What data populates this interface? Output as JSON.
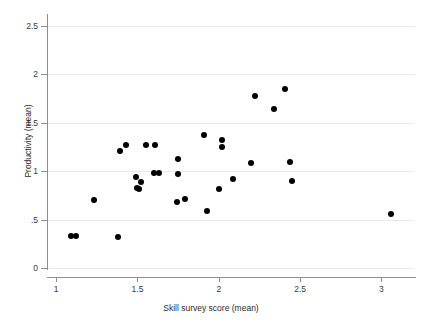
{
  "chart_data": {
    "type": "scatter",
    "title": "",
    "xlabel": "Skill survey score (mean)",
    "ylabel": "Productivity (mean)",
    "xlim": [
      0.95,
      3.2
    ],
    "ylim": [
      0,
      2.6
    ],
    "grid": true,
    "legend": "none",
    "marker": {
      "shape": "circle",
      "color": "#000000",
      "size_px": 6
    },
    "xticks": [
      1,
      1.5,
      2,
      2.5,
      3
    ],
    "xticklabels": [
      "1",
      "1.5",
      "2",
      "2.5",
      "3"
    ],
    "yticks": [
      0,
      0.5,
      1,
      1.5,
      2,
      2.5
    ],
    "yticklabels": [
      "0",
      ".5",
      "1",
      "1.5",
      "2",
      "2.5"
    ],
    "x": [
      1.09,
      1.12,
      1.23,
      1.38,
      1.39,
      1.43,
      1.49,
      1.5,
      1.51,
      1.52,
      1.55,
      1.6,
      1.61,
      1.63,
      1.74,
      1.75,
      1.75,
      1.79,
      1.91,
      1.93,
      2.0,
      2.02,
      2.02,
      2.09,
      2.2,
      2.22,
      2.34,
      2.41,
      2.44,
      2.45,
      3.06
    ],
    "y": [
      0.335,
      0.33,
      0.705,
      0.315,
      1.21,
      1.27,
      0.94,
      0.83,
      0.82,
      0.89,
      1.27,
      0.98,
      1.27,
      0.98,
      0.685,
      1.12,
      0.965,
      0.715,
      1.375,
      0.585,
      0.81,
      1.32,
      1.245,
      0.915,
      1.08,
      1.77,
      1.64,
      1.85,
      1.09,
      0.895,
      0.555
    ],
    "points": [
      {
        "x": 1.09,
        "y": 0.335
      },
      {
        "x": 1.12,
        "y": 0.33
      },
      {
        "x": 1.23,
        "y": 0.705
      },
      {
        "x": 1.38,
        "y": 0.315
      },
      {
        "x": 1.39,
        "y": 1.21
      },
      {
        "x": 1.43,
        "y": 1.27
      },
      {
        "x": 1.49,
        "y": 0.94
      },
      {
        "x": 1.5,
        "y": 0.83
      },
      {
        "x": 1.51,
        "y": 0.82
      },
      {
        "x": 1.52,
        "y": 0.89
      },
      {
        "x": 1.55,
        "y": 1.27
      },
      {
        "x": 1.6,
        "y": 0.98
      },
      {
        "x": 1.61,
        "y": 1.27
      },
      {
        "x": 1.63,
        "y": 0.98
      },
      {
        "x": 1.74,
        "y": 0.685
      },
      {
        "x": 1.75,
        "y": 1.12
      },
      {
        "x": 1.75,
        "y": 0.965
      },
      {
        "x": 1.79,
        "y": 0.715
      },
      {
        "x": 1.91,
        "y": 1.375
      },
      {
        "x": 1.93,
        "y": 0.585
      },
      {
        "x": 2.0,
        "y": 0.81
      },
      {
        "x": 2.02,
        "y": 1.32
      },
      {
        "x": 2.02,
        "y": 1.245
      },
      {
        "x": 2.09,
        "y": 0.915
      },
      {
        "x": 2.2,
        "y": 1.08
      },
      {
        "x": 2.22,
        "y": 1.77
      },
      {
        "x": 2.34,
        "y": 1.64
      },
      {
        "x": 2.41,
        "y": 1.85
      },
      {
        "x": 2.44,
        "y": 1.09
      },
      {
        "x": 2.45,
        "y": 0.895
      },
      {
        "x": 3.06,
        "y": 0.555
      }
    ],
    "n_points": 31,
    "colors": {
      "marker": "#000000",
      "axis": "#8e8e94",
      "grid": "#e9e9ec",
      "text": "#2b2b2b",
      "background": "#ffffff"
    }
  }
}
